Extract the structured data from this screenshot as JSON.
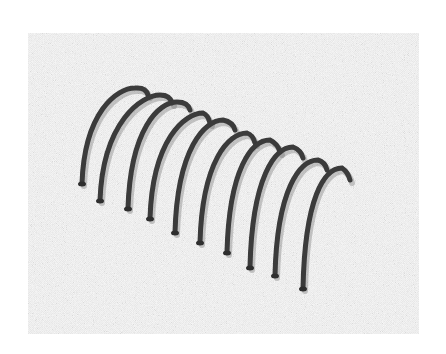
{
  "figure": {
    "description": "Grayscale halftone photograph of a helical wire coil (10 turns) partially embedded in a speckled sand-like surface",
    "background_color": "#ffffff",
    "surface_tone": "#c8c8c8",
    "wire_color": "#3a3a3a",
    "coil_turn_count": 10,
    "frame": {
      "x": 28,
      "y": 33,
      "width": 391,
      "height": 301
    },
    "coil_turns": [
      {
        "foot": [
          82,
          183
        ],
        "top": [
          135,
          88
        ],
        "end": [
          148,
          95
        ]
      },
      {
        "foot": [
          100,
          200
        ],
        "top": [
          160,
          95
        ],
        "end": [
          172,
          103
        ]
      },
      {
        "foot": [
          128,
          208
        ],
        "top": [
          177,
          102
        ],
        "end": [
          190,
          110
        ]
      },
      {
        "foot": [
          150,
          218
        ],
        "top": [
          203,
          113
        ],
        "end": [
          210,
          123
        ]
      },
      {
        "foot": [
          175,
          232
        ],
        "top": [
          223,
          120
        ],
        "end": [
          235,
          130
        ]
      },
      {
        "foot": [
          200,
          242
        ],
        "top": [
          247,
          133
        ],
        "end": [
          255,
          143
        ]
      },
      {
        "foot": [
          227,
          252
        ],
        "top": [
          270,
          140
        ],
        "end": [
          280,
          152
        ]
      },
      {
        "foot": [
          250,
          267
        ],
        "top": [
          293,
          147
        ],
        "end": [
          303,
          158
        ]
      },
      {
        "foot": [
          275,
          275
        ],
        "top": [
          318,
          160
        ],
        "end": [
          327,
          170
        ]
      },
      {
        "foot": [
          303,
          288
        ],
        "top": [
          342,
          168
        ],
        "end": [
          350,
          180
        ]
      }
    ]
  }
}
